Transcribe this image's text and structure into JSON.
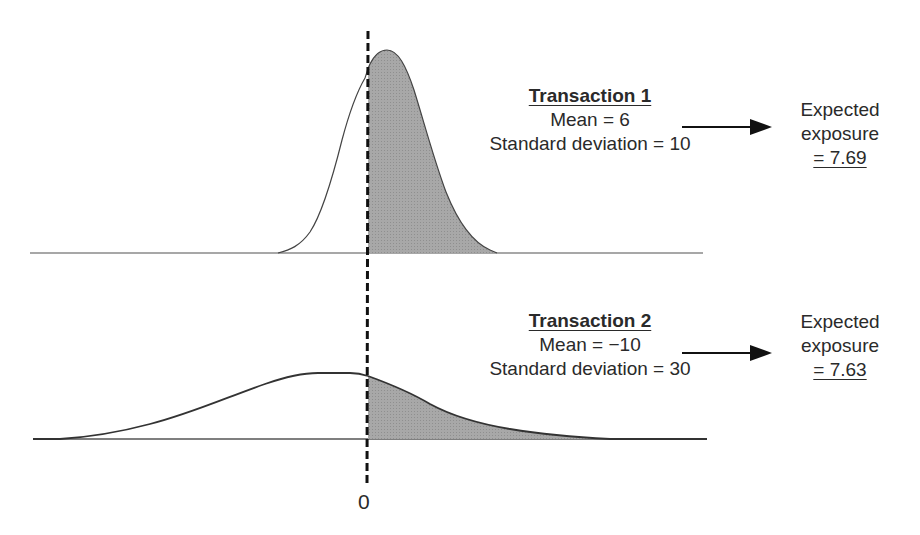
{
  "diagram": {
    "zero_label": "0",
    "transactions": [
      {
        "title": "Transaction 1",
        "mean_label": "Mean = 6",
        "sd_label": "Standard deviation = 10",
        "mean": 6,
        "sd": 10,
        "result_line1": "Expected",
        "result_line2": "exposure",
        "result_value": "= 7.69",
        "expected_exposure": 7.69
      },
      {
        "title": "Transaction 2",
        "mean_label": "Mean = −10",
        "sd_label": "Standard deviation = 30",
        "mean": -10,
        "sd": 30,
        "result_line1": "Expected",
        "result_line2": "exposure",
        "result_value": "= 7.63",
        "expected_exposure": 7.63
      }
    ],
    "colors": {
      "fill_positive": "#a9a9a9",
      "line": "#333333",
      "baseline": "#888888"
    }
  }
}
